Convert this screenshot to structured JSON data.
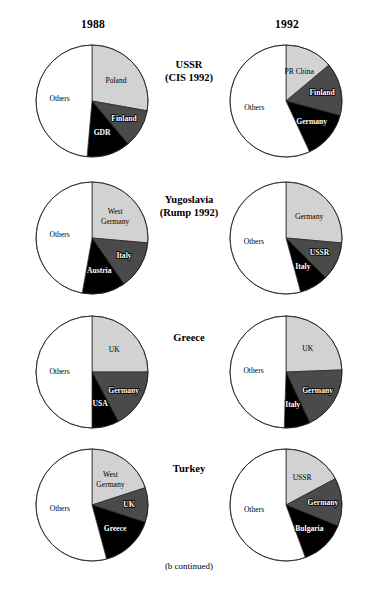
{
  "columns": [
    {
      "label": "1988"
    },
    {
      "label": "1992"
    }
  ],
  "footnote": "(b continued)",
  "palette": {
    "others": "#ffffff",
    "light_grey": "#d2d2d2",
    "dark_grey": "#4a4a4a",
    "black": "#000000",
    "outline": "#222222"
  },
  "rows": [
    {
      "title_line1": "USSR",
      "title_line2": "(CIS 1992)"
    },
    {
      "title_line1": "Yugoslavia",
      "title_line2": "(Rump 1992)"
    },
    {
      "title_line1": "Greece",
      "title_line2": ""
    },
    {
      "title_line1": "Turkey",
      "title_line2": ""
    }
  ],
  "chart_data": [
    {
      "type": "pie",
      "title": "USSR 1988",
      "row": 0,
      "column": 0,
      "year": "1988",
      "labels": [
        "Poland",
        "Finland",
        "GDR",
        "Others"
      ],
      "values": [
        27.8,
        11.1,
        12.5,
        48.6
      ],
      "colors": [
        "#d2d2d2",
        "#4a4a4a",
        "#000000",
        "#ffffff"
      ],
      "startAngle": 0,
      "label_styles": [
        "on-light",
        "on-mid",
        "on-dark",
        "on-light"
      ]
    },
    {
      "type": "pie",
      "title": "USSR (CIS) 1992",
      "row": 0,
      "column": 1,
      "year": "1992",
      "labels": [
        "PR China",
        "Finland",
        "Germany",
        "Others"
      ],
      "values": [
        13.9,
        15.3,
        13.9,
        56.9
      ],
      "colors": [
        "#d2d2d2",
        "#4a4a4a",
        "#000000",
        "#ffffff"
      ],
      "startAngle": 0,
      "label_styles": [
        "on-light",
        "on-mid",
        "on-dark",
        "on-light"
      ]
    },
    {
      "type": "pie",
      "title": "Yugoslavia 1988",
      "row": 1,
      "column": 0,
      "year": "1988",
      "labels": [
        "West Germany",
        "Italy",
        "Austria",
        "Others"
      ],
      "values": [
        26.4,
        13.9,
        12.5,
        47.2
      ],
      "colors": [
        "#d2d2d2",
        "#4a4a4a",
        "#000000",
        "#ffffff"
      ],
      "startAngle": 0,
      "label_styles": [
        "on-light",
        "on-mid",
        "on-dark",
        "on-light"
      ]
    },
    {
      "type": "pie",
      "title": "Yugoslavia (Rump) 1992",
      "row": 1,
      "column": 1,
      "year": "1992",
      "labels": [
        "Germany",
        "USSR",
        "Italy",
        "Others"
      ],
      "values": [
        26.4,
        11.1,
        8.3,
        54.2
      ],
      "colors": [
        "#d2d2d2",
        "#4a4a4a",
        "#000000",
        "#ffffff"
      ],
      "startAngle": 0,
      "label_styles": [
        "on-light",
        "on-mid",
        "on-dark",
        "on-light"
      ]
    },
    {
      "type": "pie",
      "title": "Greece 1988",
      "row": 2,
      "column": 0,
      "year": "1988",
      "labels": [
        "UK",
        "Germany",
        "USA",
        "Others"
      ],
      "values": [
        25.0,
        17.2,
        7.8,
        50.0
      ],
      "colors": [
        "#d2d2d2",
        "#4a4a4a",
        "#000000",
        "#ffffff"
      ],
      "startAngle": 0,
      "label_styles": [
        "on-light",
        "on-mid",
        "on-dark",
        "on-light"
      ]
    },
    {
      "type": "pie",
      "title": "Greece 1992",
      "row": 2,
      "column": 1,
      "year": "1992",
      "labels": [
        "UK",
        "Germany",
        "Italy",
        "Others"
      ],
      "values": [
        24.4,
        18.6,
        7.5,
        49.5
      ],
      "colors": [
        "#d2d2d2",
        "#4a4a4a",
        "#000000",
        "#ffffff"
      ],
      "startAngle": 0,
      "label_styles": [
        "on-light",
        "on-mid",
        "on-dark",
        "on-light"
      ]
    },
    {
      "type": "pie",
      "title": "Turkey 1988",
      "row": 3,
      "column": 0,
      "year": "1988",
      "labels": [
        "West Germany",
        "UK",
        "Greece",
        "Others"
      ],
      "values": [
        20.0,
        10.0,
        15.8,
        54.2
      ],
      "colors": [
        "#d2d2d2",
        "#4a4a4a",
        "#000000",
        "#ffffff"
      ],
      "startAngle": 0,
      "label_styles": [
        "on-light",
        "on-mid",
        "on-dark",
        "on-light"
      ]
    },
    {
      "type": "pie",
      "title": "Turkey 1992",
      "row": 3,
      "column": 1,
      "year": "1992",
      "labels": [
        "USSR",
        "Germany",
        "Bulgaria",
        "Others"
      ],
      "values": [
        17.2,
        13.9,
        13.3,
        55.6
      ],
      "colors": [
        "#d2d2d2",
        "#4a4a4a",
        "#000000",
        "#ffffff"
      ],
      "startAngle": 0,
      "label_styles": [
        "on-light",
        "on-mid",
        "on-dark",
        "on-light"
      ]
    }
  ],
  "layout": {
    "pie_radius": 56,
    "row_centers_y": [
      101,
      238,
      372,
      505
    ],
    "col_centers_x": [
      92,
      286
    ]
  }
}
